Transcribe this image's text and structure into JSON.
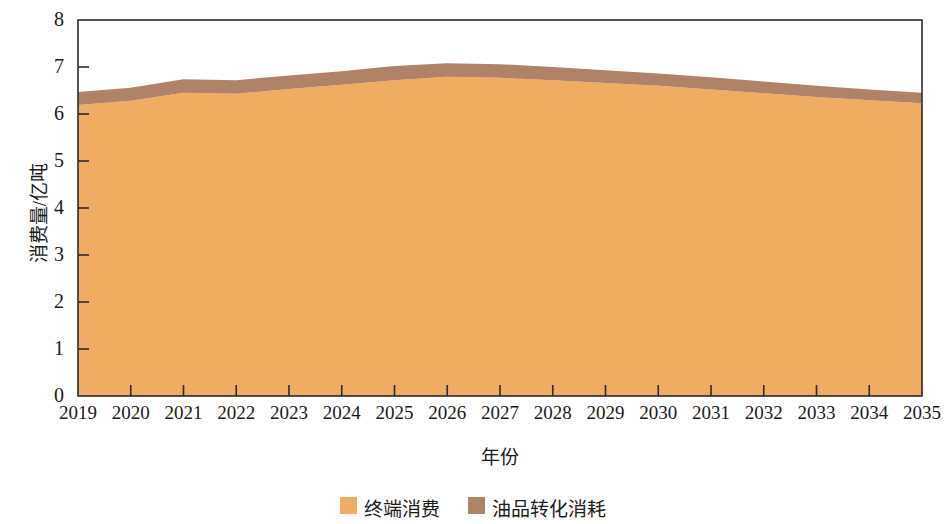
{
  "chart_data": {
    "type": "area",
    "stacked": true,
    "title": "",
    "xlabel": "年份",
    "ylabel": "消费量/亿吨",
    "categories": [
      2019,
      2020,
      2021,
      2022,
      2023,
      2024,
      2025,
      2026,
      2027,
      2028,
      2029,
      2030,
      2031,
      2032,
      2033,
      2034,
      2035
    ],
    "xtick_labels": [
      "2019",
      "2020",
      "2021",
      "2022",
      "2023",
      "2024",
      "2025",
      "2026",
      "2027",
      "2028",
      "2029",
      "2030",
      "2031",
      "2032",
      "2033",
      "2034",
      "2035"
    ],
    "ytick_labels": [
      "0",
      "1",
      "2",
      "3",
      "4",
      "5",
      "6",
      "7",
      "8"
    ],
    "ylim": [
      0,
      8
    ],
    "ytick_values": [
      0,
      1,
      2,
      3,
      4,
      5,
      6,
      7,
      8
    ],
    "grid": false,
    "legend_position": "bottom",
    "series": [
      {
        "name": "终端消费",
        "color": "#f0ac62",
        "values": [
          6.19,
          6.28,
          6.45,
          6.43,
          6.53,
          6.62,
          6.72,
          6.79,
          6.77,
          6.72,
          6.66,
          6.6,
          6.52,
          6.44,
          6.36,
          6.29,
          6.23
        ]
      },
      {
        "name": "油品转化消耗",
        "color": "#b08268",
        "values": [
          0.28,
          0.28,
          0.29,
          0.29,
          0.29,
          0.29,
          0.3,
          0.29,
          0.29,
          0.28,
          0.27,
          0.26,
          0.26,
          0.25,
          0.24,
          0.23,
          0.22
        ]
      }
    ],
    "totals": [
      6.47,
      6.56,
      6.74,
      6.72,
      6.82,
      6.91,
      7.02,
      7.08,
      7.06,
      7.0,
      6.93,
      6.86,
      6.78,
      6.69,
      6.6,
      6.52,
      6.45
    ]
  },
  "legend": {
    "items": [
      {
        "label": "终端消费",
        "color": "#f0ac62"
      },
      {
        "label": "油品转化消耗",
        "color": "#b08268"
      }
    ]
  },
  "axes": {
    "x_title": "年份",
    "y_title": "消费量/亿吨"
  },
  "colors": {
    "terminal_consumption": "#f0ac62",
    "oil_conversion": "#b08268",
    "axis": "#2b2b2b",
    "background": "#ffffff"
  }
}
